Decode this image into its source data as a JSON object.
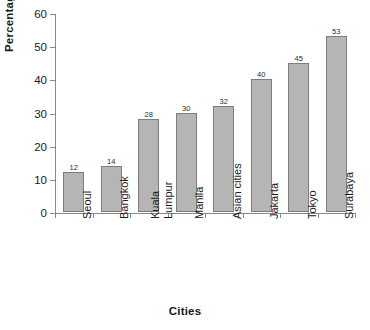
{
  "chart_data": {
    "type": "bar",
    "title": "",
    "xlabel": "Cities",
    "ylabel": "Percentage",
    "categories": [
      "Seoul",
      "Bangkok",
      "Kuala Lumpur",
      "Manila",
      "Asian cities",
      "Jakarta",
      "Tokyo",
      "Surabaya"
    ],
    "values": [
      12,
      14,
      28,
      30,
      32,
      40,
      45,
      53
    ],
    "value_labels": [
      "12",
      "14",
      "28",
      "30",
      "32",
      "40",
      "45",
      "53"
    ],
    "ylim": [
      0,
      60
    ],
    "ytick_labels": [
      "0",
      "10",
      "20",
      "30",
      "40",
      "50",
      "60"
    ],
    "ytick_values": [
      0,
      10,
      20,
      30,
      40,
      50,
      60
    ],
    "grid": false,
    "legend": false,
    "legend_position": "none",
    "bar_color": "#b5b5b5",
    "bar_border_color": "#7d7d7d",
    "axis_color": "#8a8a8a",
    "text_color": "#1a1a1a",
    "background": "#ffffff",
    "category_label_rotation": -90
  },
  "category_lines": [
    [
      "Seoul"
    ],
    [
      "Bangkok"
    ],
    [
      "Kuala",
      "Lumpur"
    ],
    [
      "Manila"
    ],
    [
      "Asian cities"
    ],
    [
      "Jakarta"
    ],
    [
      "Tokyo"
    ],
    [
      "Surabaya"
    ]
  ]
}
